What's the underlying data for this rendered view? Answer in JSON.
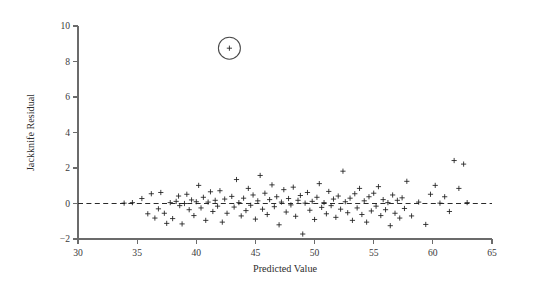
{
  "figure": {
    "kind": "residual-diagnostic-scatter",
    "background": "#ffffff",
    "marker_color": "#1d1d1d",
    "axis_color": "#6b6b6b",
    "zero_line_color": "#2a2a2a",
    "annotation_color": "#4a4a4a"
  },
  "corner_mark": {
    "name": "page-corner-mark",
    "color": "#000000"
  },
  "chart_data": {
    "type": "scatter",
    "title": "",
    "xlabel": "Predicted Value",
    "ylabel": "Jackknife Residual",
    "xlim": [
      30,
      65
    ],
    "ylim": [
      -2,
      10
    ],
    "xticks": [
      30,
      35,
      40,
      45,
      50,
      55,
      60,
      65
    ],
    "xticklabels": [
      "30",
      "35",
      "40",
      "45",
      "50",
      "55",
      "60",
      "65"
    ],
    "yticks": [
      -2,
      0,
      2,
      4,
      6,
      8,
      10
    ],
    "yticklabels": [
      "−2",
      "0",
      "2",
      "4",
      "6",
      "8",
      "10"
    ],
    "grid": false,
    "legend": null,
    "marker_style": "plus",
    "reference_lines": [
      {
        "name": "zero-residual-line",
        "orientation": "horizontal",
        "y": 0,
        "style": "dashed"
      }
    ],
    "annotations": [
      {
        "name": "outlier-circle",
        "shape": "circle",
        "x": 42.8,
        "y": 8.75,
        "radius_px": 11,
        "note": "circled high outlier"
      }
    ],
    "points": [
      [
        33.9,
        0.02
      ],
      [
        34.6,
        0.05
      ],
      [
        35.4,
        0.28
      ],
      [
        35.9,
        -0.58
      ],
      [
        36.2,
        0.55
      ],
      [
        36.5,
        -0.82
      ],
      [
        36.8,
        -0.3
      ],
      [
        37.0,
        0.62
      ],
      [
        37.3,
        -0.55
      ],
      [
        37.5,
        -1.12
      ],
      [
        37.8,
        0.05
      ],
      [
        38.0,
        -0.85
      ],
      [
        38.3,
        0.12
      ],
      [
        38.5,
        0.42
      ],
      [
        38.6,
        -0.12
      ],
      [
        38.8,
        -1.15
      ],
      [
        39.0,
        0.0
      ],
      [
        39.2,
        0.52
      ],
      [
        39.4,
        -0.35
      ],
      [
        39.6,
        0.2
      ],
      [
        39.8,
        -0.68
      ],
      [
        40.0,
        0.1
      ],
      [
        40.2,
        1.02
      ],
      [
        40.4,
        -0.25
      ],
      [
        40.6,
        0.35
      ],
      [
        40.8,
        -0.95
      ],
      [
        41.0,
        0.08
      ],
      [
        41.2,
        0.66
      ],
      [
        41.4,
        -0.45
      ],
      [
        41.6,
        0.18
      ],
      [
        41.8,
        -0.15
      ],
      [
        42.0,
        0.72
      ],
      [
        42.2,
        -1.05
      ],
      [
        42.4,
        0.25
      ],
      [
        42.6,
        -0.55
      ],
      [
        42.8,
        8.75
      ],
      [
        43.0,
        0.4
      ],
      [
        43.2,
        -0.2
      ],
      [
        43.4,
        1.35
      ],
      [
        43.6,
        0.05
      ],
      [
        43.8,
        -0.7
      ],
      [
        44.0,
        0.3
      ],
      [
        44.2,
        -0.4
      ],
      [
        44.4,
        0.85
      ],
      [
        44.6,
        -0.1
      ],
      [
        44.8,
        0.48
      ],
      [
        45.0,
        -0.88
      ],
      [
        45.2,
        0.15
      ],
      [
        45.4,
        1.58
      ],
      [
        45.6,
        -0.32
      ],
      [
        45.8,
        0.58
      ],
      [
        46.0,
        -0.62
      ],
      [
        46.2,
        0.22
      ],
      [
        46.4,
        1.05
      ],
      [
        46.6,
        -0.18
      ],
      [
        46.8,
        0.38
      ],
      [
        47.0,
        -1.2
      ],
      [
        47.2,
        0.08
      ],
      [
        47.4,
        0.78
      ],
      [
        47.6,
        -0.48
      ],
      [
        47.8,
        0.28
      ],
      [
        48.0,
        -0.08
      ],
      [
        48.2,
        0.92
      ],
      [
        48.4,
        -0.72
      ],
      [
        48.6,
        0.18
      ],
      [
        48.8,
        0.45
      ],
      [
        49.0,
        -1.72
      ],
      [
        49.2,
        0.02
      ],
      [
        49.4,
        0.62
      ],
      [
        49.6,
        -0.38
      ],
      [
        49.8,
        0.12
      ],
      [
        50.0,
        -0.9
      ],
      [
        50.2,
        0.35
      ],
      [
        50.4,
        1.12
      ],
      [
        50.6,
        -0.22
      ],
      [
        50.8,
        0.05
      ],
      [
        51.0,
        -0.58
      ],
      [
        51.2,
        0.68
      ],
      [
        51.4,
        -0.12
      ],
      [
        51.6,
        0.25
      ],
      [
        51.8,
        -0.78
      ],
      [
        52.0,
        0.42
      ],
      [
        52.2,
        -0.32
      ],
      [
        52.4,
        1.82
      ],
      [
        52.6,
        0.1
      ],
      [
        52.8,
        -0.52
      ],
      [
        53.0,
        0.3
      ],
      [
        53.2,
        -0.95
      ],
      [
        53.4,
        0.55
      ],
      [
        53.6,
        -0.25
      ],
      [
        53.8,
        0.85
      ],
      [
        54.0,
        -0.62
      ],
      [
        54.2,
        0.15
      ],
      [
        54.4,
        -1.05
      ],
      [
        54.6,
        0.38
      ],
      [
        54.8,
        -0.42
      ],
      [
        55.0,
        0.58
      ],
      [
        55.2,
        -0.15
      ],
      [
        55.4,
        0.95
      ],
      [
        55.6,
        -0.68
      ],
      [
        55.8,
        0.22
      ],
      [
        56.0,
        -0.35
      ],
      [
        56.2,
        0.05
      ],
      [
        56.4,
        -1.25
      ],
      [
        56.6,
        0.48
      ],
      [
        56.8,
        -0.55
      ],
      [
        57.0,
        0.18
      ],
      [
        57.2,
        -0.82
      ],
      [
        57.4,
        0.32
      ],
      [
        57.6,
        -0.28
      ],
      [
        57.8,
        1.25
      ],
      [
        58.2,
        -0.7
      ],
      [
        58.8,
        0.08
      ],
      [
        59.4,
        -1.18
      ],
      [
        59.8,
        0.52
      ],
      [
        60.2,
        1.02
      ],
      [
        60.6,
        0.02
      ],
      [
        61.0,
        0.38
      ],
      [
        61.4,
        -0.45
      ],
      [
        61.8,
        2.42
      ],
      [
        62.2,
        0.85
      ],
      [
        62.6,
        2.22
      ],
      [
        62.9,
        0.05
      ]
    ]
  }
}
